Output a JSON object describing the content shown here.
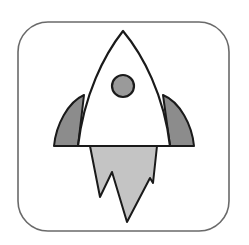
{
  "icon": {
    "name": "rocket-app-icon",
    "colors": {
      "background": "#ffffff",
      "frame_stroke": "#6a6a6a",
      "outline": "#1a1a1a",
      "fins": "#8c8c8c",
      "window": "#9a9a9a",
      "flame": "#c4c4c4",
      "body": "#ffffff"
    }
  }
}
